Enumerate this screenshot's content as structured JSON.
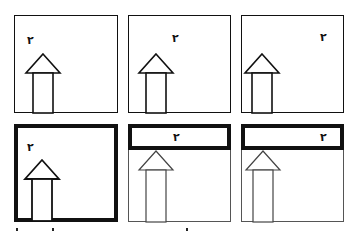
{
  "diagram": {
    "label_glyph": "٢",
    "colors": {
      "stroke": "#111111",
      "background": "#ffffff"
    },
    "panels": [
      {
        "id": 1,
        "row": 1,
        "frame": "thin",
        "label": "٢",
        "label_position": "top-left"
      },
      {
        "id": 2,
        "row": 1,
        "frame": "thin",
        "label": "٢",
        "label_position": "top-center"
      },
      {
        "id": 3,
        "row": 1,
        "frame": "thin",
        "label": "٢",
        "label_position": "top-right"
      },
      {
        "id": 4,
        "row": 2,
        "frame": "thick",
        "label": "٢",
        "label_position": "top-left"
      },
      {
        "id": 5,
        "row": 2,
        "frame": "thin-with-thick-top-band",
        "label": "٢",
        "label_position": "band-center"
      },
      {
        "id": 6,
        "row": 2,
        "frame": "thin-with-thick-top-band",
        "label": "٢",
        "label_position": "band-right"
      }
    ]
  }
}
